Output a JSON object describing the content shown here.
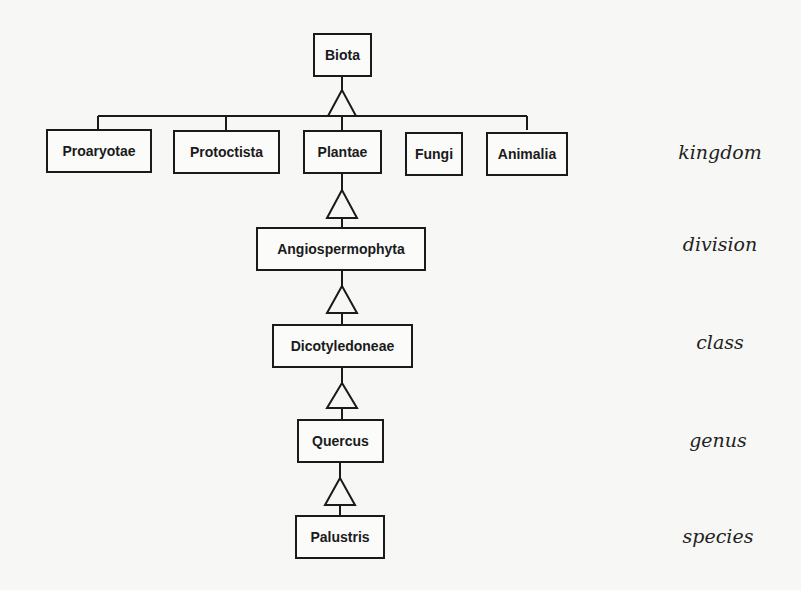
{
  "diagram": {
    "type": "taxonomy-hierarchy",
    "root": {
      "label": "Biota"
    },
    "kingdoms": [
      {
        "label": "Proaryotae"
      },
      {
        "label": "Protoctista"
      },
      {
        "label": "Plantae"
      },
      {
        "label": "Fungi"
      },
      {
        "label": "Animalia"
      }
    ],
    "division": {
      "label": "Angiospermophyta"
    },
    "class": {
      "label": "Dicotyledoneae"
    },
    "genus": {
      "label": "Quercus"
    },
    "species": {
      "label": "Palustris"
    },
    "rank_labels": {
      "kingdom": "kingdom",
      "division": "division",
      "class": "class",
      "genus": "genus",
      "species": "species"
    },
    "relation_symbol": "generalization-triangle",
    "colors": {
      "line": "#1a1a1a",
      "background": "#f7f7f5"
    }
  }
}
